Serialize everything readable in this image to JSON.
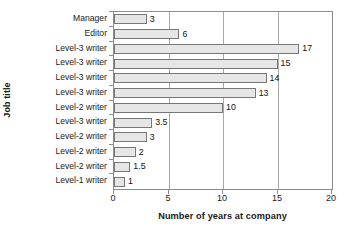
{
  "chart_data": {
    "type": "bar",
    "orientation": "horizontal",
    "title": "",
    "xlabel": "Number of years at company",
    "ylabel": "Job title",
    "xlim": [
      0,
      20
    ],
    "xticks": [
      0,
      5,
      10,
      15,
      20
    ],
    "xtick_labels": [
      "0",
      "5",
      "10",
      "15",
      "20"
    ],
    "grid": "vertical",
    "legend": "none",
    "categories": [
      "Manager",
      "Editor",
      "Level-3 writer",
      "Level-3 writer",
      "Level-3 writer",
      "Level-3 writer",
      "Level-2 writer",
      "Level-3 writer",
      "Level-2 writer",
      "Level-2 writer",
      "Level-2 writer",
      "Level-1 writer"
    ],
    "values": [
      3,
      6,
      17,
      15,
      14,
      13,
      10,
      3.5,
      3,
      2,
      1.5,
      1
    ],
    "value_labels": [
      "3",
      "6",
      "17",
      "15",
      "14",
      "13",
      "10",
      "3.5",
      "3",
      "2",
      "1.5",
      "1"
    ],
    "colors": {
      "bar_fill": "#e6e6e6",
      "bar_border": "#767676",
      "axis": "#8c8c8c",
      "gridline": "#a8a8a8",
      "text": "#1a1a1a",
      "background": "#ffffff"
    }
  }
}
